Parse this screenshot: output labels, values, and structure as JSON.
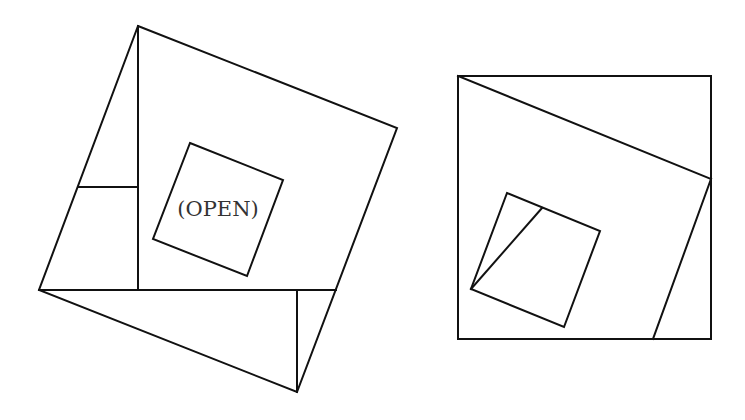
{
  "figures": [
    {
      "name": "left-figure",
      "description": "Tilted outer square subdivided into a central open square region plus surrounding triangles and rectangle pieces",
      "outer_square": [
        [
          138,
          26
        ],
        [
          397,
          128
        ],
        [
          297,
          392
        ],
        [
          39,
          290
        ]
      ],
      "inner_square": [
        [
          190,
          143
        ],
        [
          283,
          180
        ],
        [
          247,
          276
        ],
        [
          153,
          239
        ]
      ],
      "segments": [
        [
          [
            138,
            26
          ],
          [
            138,
            290
          ]
        ],
        [
          [
            39,
            290
          ],
          [
            336,
            290
          ]
        ],
        [
          [
            78,
            187
          ],
          [
            138,
            187
          ]
        ],
        [
          [
            297,
            290
          ],
          [
            297,
            392
          ]
        ]
      ],
      "label": {
        "text": "(OPEN)",
        "x": 218,
        "y": 216
      }
    },
    {
      "name": "right-figure",
      "description": "Axis-aligned square containing a tilted square corner cut and a small inner tilted square with a diagonal",
      "outer_square": [
        [
          458,
          76
        ],
        [
          711,
          76
        ],
        [
          711,
          339
        ],
        [
          458,
          339
        ]
      ],
      "segments": [
        [
          [
            458,
            76
          ],
          [
            711,
            179
          ]
        ],
        [
          [
            711,
            179
          ],
          [
            653,
            339
          ]
        ]
      ],
      "inner_square": [
        [
          507,
          193
        ],
        [
          600,
          231
        ],
        [
          564,
          327
        ],
        [
          471,
          289
        ]
      ],
      "inner_diagonal": [
        [
          471,
          289
        ],
        [
          542,
          208
        ]
      ]
    }
  ],
  "colors": {
    "line": "#111111",
    "text": "#333333",
    "background": "#ffffff"
  }
}
